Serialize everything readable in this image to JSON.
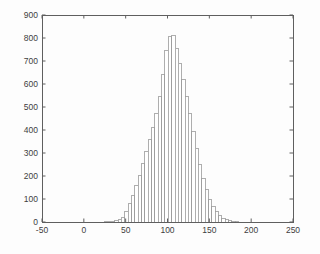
{
  "figure": {
    "background": "#fdfdfd",
    "axis_color": "#5f5f5f",
    "bar_edge_color": "#9a9a9a",
    "bar_fill_color": "#ffffff",
    "label_color": "#3d3d3d"
  },
  "chart_data": {
    "type": "bar",
    "subtype": "histogram",
    "grid": false,
    "legend_position": "none",
    "xlim": [
      -50,
      250
    ],
    "ylim": [
      0,
      900
    ],
    "x_ticks": [
      "-50",
      "0",
      "50",
      "100",
      "150",
      "200",
      "250"
    ],
    "x_tick_values": [
      -50,
      0,
      50,
      100,
      150,
      200,
      250
    ],
    "y_ticks": [
      "0",
      "100",
      "200",
      "300",
      "400",
      "500",
      "600",
      "700",
      "800",
      "900"
    ],
    "y_tick_values": [
      0,
      100,
      200,
      300,
      400,
      500,
      600,
      700,
      800,
      900
    ],
    "bin_width": 4,
    "bin_centers": [
      27,
      31,
      35,
      39,
      43,
      47,
      51,
      55,
      59,
      63,
      67,
      71,
      75,
      79,
      83,
      87,
      91,
      95,
      99,
      103,
      107,
      111,
      115,
      119,
      123,
      127,
      131,
      135,
      139,
      143,
      147,
      151,
      155,
      159,
      163,
      167,
      171,
      175,
      179,
      183
    ],
    "values": [
      2,
      4,
      3,
      6,
      10,
      21,
      45,
      80,
      117,
      160,
      204,
      255,
      306,
      357,
      410,
      470,
      545,
      640,
      745,
      805,
      812,
      755,
      690,
      620,
      545,
      470,
      395,
      320,
      250,
      190,
      140,
      100,
      68,
      44,
      27,
      16,
      9,
      5,
      3,
      1
    ]
  }
}
